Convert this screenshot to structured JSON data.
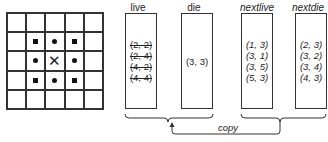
{
  "grid": {
    "rows": 5,
    "cols": 5,
    "cells": [
      [
        "",
        "",
        "",
        "",
        ""
      ],
      [
        "",
        "square",
        "dot",
        "square",
        ""
      ],
      [
        "",
        "dot",
        "x",
        "dot",
        ""
      ],
      [
        "",
        "square",
        "dot",
        "square",
        ""
      ],
      [
        "",
        "",
        "",
        "",
        ""
      ]
    ]
  },
  "lists": [
    {
      "label": "live",
      "italic": false,
      "entries": [
        "(2, 2)",
        "(2, 4)",
        "(4, 2)",
        "(4, 4)"
      ],
      "struck": true
    },
    {
      "label": "die",
      "italic": false,
      "entries": [
        "(3, 3)"
      ],
      "struck": false
    },
    {
      "label": "nextlive",
      "italic": true,
      "entries": [
        "(1, 3)",
        "(3, 1)",
        "(3, 5)",
        "(5, 3)"
      ],
      "struck": false
    },
    {
      "label": "nextdie",
      "italic": true,
      "entries": [
        "(2, 3)",
        "(3, 2)",
        "(3, 4)",
        "(4, 3)"
      ],
      "struck": false
    }
  ],
  "copy_label": "copy"
}
